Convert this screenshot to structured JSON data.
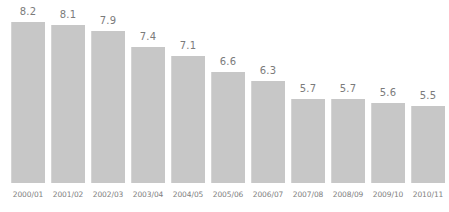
{
  "chart_data": {
    "type": "bar",
    "title": "",
    "subtitle": "",
    "xlabel": "",
    "ylabel": "",
    "legend": [],
    "grid": false,
    "categories": [
      "2000/01",
      "2001/02",
      "2002/03",
      "2003/04",
      "2004/05",
      "2005/06",
      "2006/07",
      "2007/08",
      "2008/09",
      "2009/10",
      "2010/11"
    ],
    "values": [
      8.2,
      8.1,
      7.9,
      7.4,
      7.1,
      6.6,
      6.3,
      5.7,
      5.7,
      5.6,
      5.5
    ],
    "value_labels": [
      "8.2",
      "8.1",
      "7.9",
      "7.4",
      "7.1",
      "6.6",
      "6.3",
      "5.7",
      "5.7",
      "5.6",
      "5.5"
    ],
    "ylim": [
      3.0,
      8.6
    ],
    "bar_color": "#c7c7c7",
    "value_label_color": "#7b7b7b",
    "category_label_color": "#808080",
    "background_color": "#ffffff"
  }
}
